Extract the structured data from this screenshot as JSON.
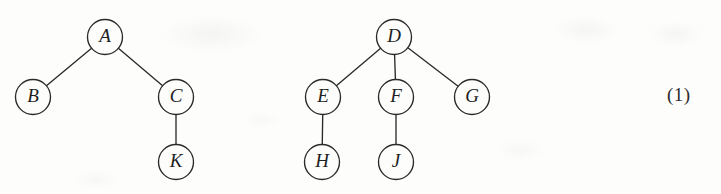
{
  "figure": {
    "caption_tag": "(1)",
    "width": 721,
    "height": 194,
    "background_color": "#fdfdfc",
    "ink_color": "#2b2b2b",
    "node_radius": 17.5
  },
  "chart_data": {
    "type": "diagram",
    "subtype": "rooted-tree-forest",
    "title": "",
    "xlabel": "",
    "ylabel": "",
    "trees": [
      {
        "name": "left-tree",
        "root": "A",
        "nodes": [
          {
            "id": "A",
            "label": "A",
            "x": 105,
            "y": 37,
            "depth": 0
          },
          {
            "id": "B",
            "label": "B",
            "x": 33,
            "y": 97,
            "depth": 1
          },
          {
            "id": "C",
            "label": "C",
            "x": 176,
            "y": 97,
            "depth": 1
          },
          {
            "id": "K",
            "label": "K",
            "x": 176,
            "y": 162,
            "depth": 2
          }
        ],
        "edges": [
          {
            "from": "A",
            "to": "B"
          },
          {
            "from": "A",
            "to": "C"
          },
          {
            "from": "C",
            "to": "K"
          }
        ]
      },
      {
        "name": "right-tree",
        "root": "D",
        "nodes": [
          {
            "id": "D",
            "label": "D",
            "x": 394,
            "y": 37,
            "depth": 0
          },
          {
            "id": "E",
            "label": "E",
            "x": 323,
            "y": 97,
            "depth": 1
          },
          {
            "id": "F",
            "label": "F",
            "x": 396,
            "y": 97,
            "depth": 1
          },
          {
            "id": "G",
            "label": "G",
            "x": 472,
            "y": 97,
            "depth": 1
          },
          {
            "id": "H",
            "label": "H",
            "x": 322,
            "y": 162,
            "depth": 2
          },
          {
            "id": "J",
            "label": "J",
            "x": 396,
            "y": 162,
            "depth": 2
          }
        ],
        "edges": [
          {
            "from": "D",
            "to": "E"
          },
          {
            "from": "D",
            "to": "F"
          },
          {
            "from": "D",
            "to": "G"
          },
          {
            "from": "E",
            "to": "H"
          },
          {
            "from": "F",
            "to": "J"
          }
        ]
      }
    ],
    "annotations": [
      {
        "id": "equation-number",
        "text": "(1)",
        "x": 683,
        "y": 97
      }
    ]
  }
}
